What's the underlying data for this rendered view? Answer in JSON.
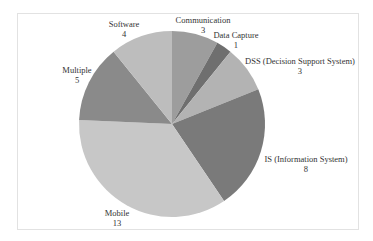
{
  "chart_data": {
    "type": "pie",
    "title": "",
    "start_angle": "12 o'clock, clockwise",
    "categories": [
      "Communication",
      "Data Capture",
      "DSS (Decision Support System)",
      "IS (Information System)",
      "Mobile",
      "Multiple",
      "Software"
    ],
    "values": [
      3,
      1,
      3,
      8,
      13,
      5,
      4
    ],
    "colors": [
      "#9d9d9d",
      "#6f6f6f",
      "#b3b3b3",
      "#7a7a7a",
      "#c7c7c7",
      "#8a8a8a",
      "#bdbdbd"
    ],
    "data_labels": true,
    "legend": "none"
  },
  "labels": [
    {
      "name": "Communication",
      "value": "3"
    },
    {
      "name": "Data Capture",
      "value": "1"
    },
    {
      "name": "DSS (Decision Support System)",
      "value": "3"
    },
    {
      "name": "IS (Information System)",
      "value": "8"
    },
    {
      "name": "Mobile",
      "value": "13"
    },
    {
      "name": "Multiple",
      "value": "5"
    },
    {
      "name": "Software",
      "value": "4"
    }
  ]
}
